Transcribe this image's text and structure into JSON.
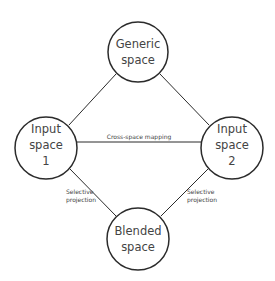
{
  "diagram": {
    "nodes": {
      "generic": {
        "lines": [
          "Generic",
          "space"
        ]
      },
      "input1": {
        "lines": [
          "Input",
          "space",
          "1"
        ]
      },
      "input2": {
        "lines": [
          "Input",
          "space",
          "2"
        ]
      },
      "blended": {
        "lines": [
          "Blended",
          "space"
        ]
      }
    },
    "edges": {
      "cross_space": {
        "label": "Cross-space mapping"
      },
      "projection_left": {
        "lines": [
          "Selective",
          "projection"
        ]
      },
      "projection_right": {
        "lines": [
          "Selective",
          "projection"
        ]
      }
    },
    "colors": {
      "stroke": "#2b2b2b",
      "text": "#444444",
      "background": "#ffffff"
    }
  }
}
